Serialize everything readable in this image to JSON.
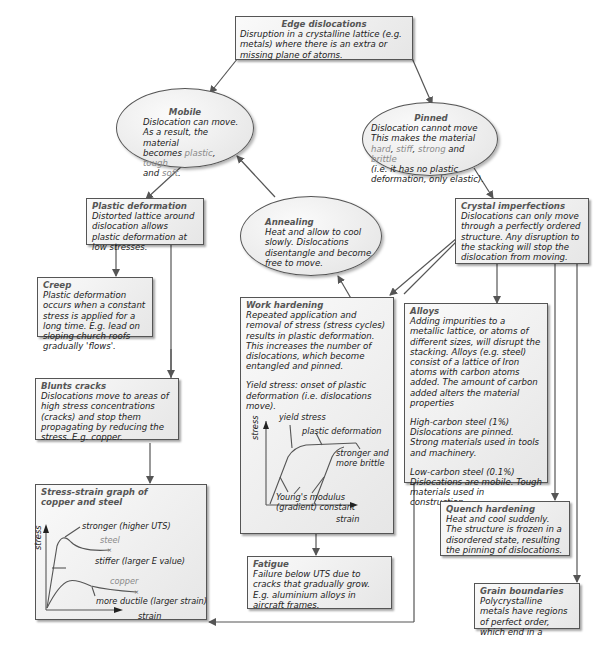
{
  "nodes": {
    "edge_dislocations": {
      "title": "Edge dislocations",
      "text": "Disruption in a crystalline lattice (e.g. metals) where there is an extra or missing plane of atoms."
    },
    "mobile": {
      "title": "Mobile",
      "line1": "Dislocation can move.",
      "line2": "As a result, the material",
      "line3_prefix": "becomes ",
      "word_plastic": "plastic",
      "sep1": ", ",
      "word_tough": "tough",
      "line4_prefix": "and ",
      "word_soft": "soft",
      "line4_suffix": "."
    },
    "pinned": {
      "title": "Pinned",
      "line1": "Dislocation cannot move",
      "line2": "This makes the material",
      "word_hard": "hard",
      "sep1": ", ",
      "word_stiff": "stiff",
      "sep2": ", ",
      "word_strong": "strong",
      "and": " and ",
      "word_brittle": "brittle",
      "line4": "(i.e. it has no plastic deformation, only elastic)."
    },
    "plastic_deformation": {
      "title": "Plastic deformation",
      "text": "Distorted lattice around dislocation allows plastic deformation at low stresses."
    },
    "annealing": {
      "title": "Annealing",
      "text": "Heat and allow to cool slowly. Dislocations disentangle and become free to move."
    },
    "crystal_imperfections": {
      "title": "Crystal imperfections",
      "text": "Dislocations can only move through a perfectly ordered structure.  Any disruption to the stacking will stop the dislocation from moving."
    },
    "creep": {
      "title": "Creep",
      "text": "Plastic deformation occurs when a constant stress is applied for a long time. E.g. lead on sloping church roofs gradually 'flows'."
    },
    "work_hardening": {
      "title": "Work hardening",
      "text": "Repeated application and removal of stress (stress cycles) results in plastic deformation.  This increases the number of dislocations, which become entangled and pinned.",
      "yield_text": "Yield stress: onset of plastic deformation (i.e. dislocations move).",
      "graph": {
        "ylabel": "stress",
        "xlabel": "strain",
        "label_yield": "yield stress",
        "label_plastic": "plastic deformation",
        "label_stronger_1": "stronger and",
        "label_stronger_2": "more brittle",
        "label_youngs_1": "Young's modulus",
        "label_youngs_2": "(gradient) constant"
      }
    },
    "alloys": {
      "title": "Alloys",
      "text": "Adding impurities to a metallic lattice, or atoms of different sizes, will disrupt the stacking.  Alloys (e.g. steel) consist of a lattice of Iron atoms with carbon atoms added.  The amount of carbon added alters the material properties",
      "high_title": "High-carbon steel (1%)",
      "high_text": "Dislocations are pinned. Strong materials used in tools and machinery.",
      "low_title": "Low-carbon steel (0.1%)",
      "low_text": "Dislocations are mobile.  Tough materials used in construction."
    },
    "blunts_cracks": {
      "title": "Blunts cracks",
      "text": "Dislocations move to areas of high stress concentrations (cracks) and stop them propagating by reducing the stress.  E.g. copper."
    },
    "stress_strain_graph": {
      "title": "Stress-strain graph of copper and steel",
      "graph": {
        "ylabel": "stress",
        "xlabel": "strain",
        "label_stronger": "stronger (higher UTS)",
        "label_steel": "steel",
        "label_stiffer": "stiffer (larger E value)",
        "label_copper": "copper",
        "label_ductile": "more ductile (larger strain)"
      }
    },
    "fatigue": {
      "title": "Fatigue",
      "text": "Failure below UTS due to cracks that gradually grow. E.g. aluminium alloys in aircraft frames."
    },
    "quench_hardening": {
      "title": "Quench hardening",
      "text": "Heat and cool suddenly. The structure is frozen in a disordered state, resulting the pinning of dislocations."
    },
    "grain_boundaries": {
      "title": "Grain boundaries",
      "text": "Polycrystalline metals have regions of perfect order, which end in a"
    }
  },
  "colors": {
    "line": "#555555",
    "title_grey": "#555555",
    "highlight_grey": "#8a8a8a",
    "box_fill": "#eeeeee"
  }
}
